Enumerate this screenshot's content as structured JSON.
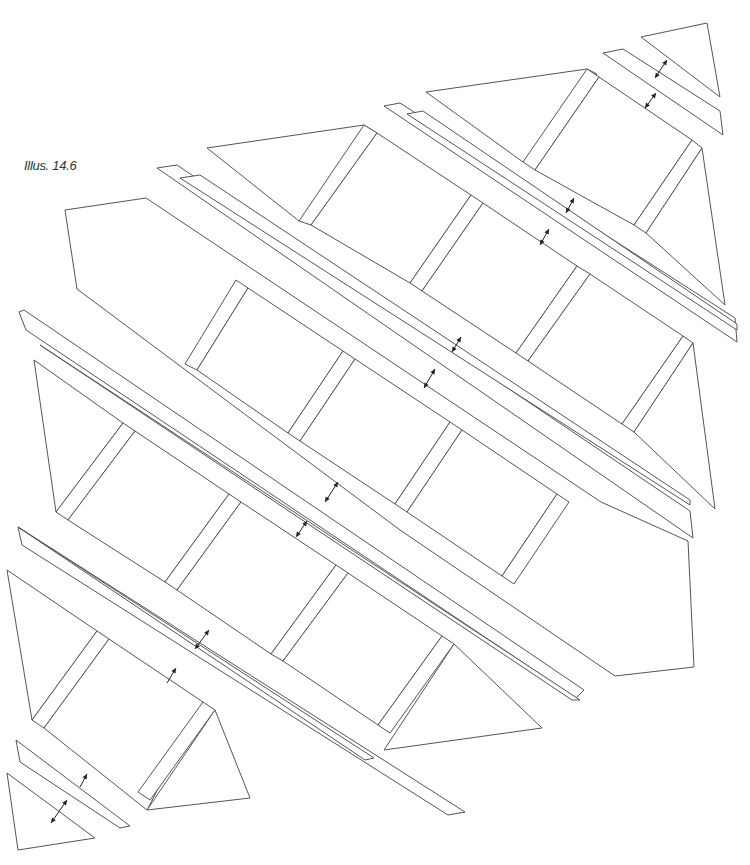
{
  "caption": "Illus. 14.6",
  "colors": {
    "stroke": "#555555",
    "arrow": "#222222",
    "background": "#ffffff"
  },
  "pieces": [
    {
      "id": "tri-top-right-corner",
      "points": "641,37 707,23 720,97"
    },
    {
      "id": "strip-a-top",
      "points": "603,53 623,49 720,111 723,135"
    },
    {
      "id": "row1-left-tri",
      "points": "426,92 587,69 597,74 523,162"
    },
    {
      "id": "row1-sash-1",
      "points": "587,69 599,77 535,170 523,162"
    },
    {
      "id": "row1-block-1",
      "points": "599,77 692,140 634,225 535,170"
    },
    {
      "id": "row1-sash-2",
      "points": "692,140 702,148 646,233 634,225"
    },
    {
      "id": "row1-right-tri",
      "points": "702,148 725,305 646,233"
    },
    {
      "id": "strip-b1",
      "points": "384,106 400,103 735,318 737,342"
    },
    {
      "id": "strip-b2",
      "points": "407,114 423,111 737,324 737,330"
    },
    {
      "id": "row2-left-tri",
      "points": "207,148 364,125 377,133 299,221"
    },
    {
      "id": "row2-sash-1",
      "points": "364,125 377,133 311,225 299,221"
    },
    {
      "id": "row2-block-1",
      "points": "377,133 471,195 410,283 311,225"
    },
    {
      "id": "row2-sash-2",
      "points": "471,195 483,203 422,291 410,283"
    },
    {
      "id": "row2-block-2",
      "points": "483,203 577,266 516,353 422,291"
    },
    {
      "id": "row2-sash-3",
      "points": "577,266 590,274 528,361 516,353"
    },
    {
      "id": "row2-block-3",
      "points": "590,274 683,336 622,424 528,361"
    },
    {
      "id": "row2-sash-4",
      "points": "683,336 693,343 634,432 622,424"
    },
    {
      "id": "row2-right-tri",
      "points": "693,343 715,509 634,432"
    },
    {
      "id": "strip-c1",
      "points": "157,168 177,165 690,511 693,538"
    },
    {
      "id": "strip-c2",
      "points": "180,178 200,175 690,500 690,505"
    },
    {
      "id": "hex-row",
      "points": "65,210 146,198 601,502 688,541 694,667 615,676 400,530 77,289"
    },
    {
      "id": "hex-sash-1",
      "points": "236,280 248,288 197,370 185,364"
    },
    {
      "id": "hex-block-1",
      "points": "248,288 343,351 288,433 197,370"
    },
    {
      "id": "hex-sash-2",
      "points": "343,351 355,359 300,441 288,433"
    },
    {
      "id": "hex-block-2",
      "points": "355,359 450,422 395,504 300,441"
    },
    {
      "id": "hex-sash-3",
      "points": "450,422 462,430 407,512 395,504"
    },
    {
      "id": "hex-block-3",
      "points": "462,430 557,494 502,576 407,512"
    },
    {
      "id": "hex-sash-4",
      "points": "557,494 569,502 514,584 502,576"
    },
    {
      "id": "strip-d1",
      "points": "19,312 24,310 584,690 576,698 26,330"
    },
    {
      "id": "strip-d2",
      "points": "40,345 572,700 580,700"
    },
    {
      "id": "row4-left-tri",
      "points": "34,360 123,423 56,512"
    },
    {
      "id": "row4-sash-1",
      "points": "123,423 135,431 68,520 56,512"
    },
    {
      "id": "row4-block-1",
      "points": "135,431 229,494 165,582 68,520"
    },
    {
      "id": "row4-sash-2",
      "points": "229,494 241,502 177,590 165,582"
    },
    {
      "id": "row4-block-2",
      "points": "241,502 336,565 271,654 177,590"
    },
    {
      "id": "row4-sash-3",
      "points": "336,565 348,573 283,661 271,654"
    },
    {
      "id": "row4-block-3",
      "points": "348,573 442,636 378,725 283,661"
    },
    {
      "id": "row4-sash-4",
      "points": "442,636 454,644 390,733 378,725"
    },
    {
      "id": "row4-right-tri",
      "points": "454,644 542,728 384,750"
    },
    {
      "id": "strip-e1",
      "points": "18,527 22,545 448,815 465,812"
    },
    {
      "id": "strip-e2",
      "points": "18,527 365,760 374,758"
    },
    {
      "id": "row5-left-tri",
      "points": "7,570 97,631 32,720"
    },
    {
      "id": "row5-sash-1",
      "points": "97,631 109,639 44,728 32,720"
    },
    {
      "id": "row5-block-1",
      "points": "109,639 203,702 147,810 44,728"
    },
    {
      "id": "row5-sash-2",
      "points": "203,702 215,710 150,800 138,792"
    },
    {
      "id": "row5-right-tri",
      "points": "215,710 250,798 147,810"
    },
    {
      "id": "strip-f",
      "points": "16,740 20,762 120,828 130,826"
    },
    {
      "id": "tri-bottom-left-corner",
      "points": "7,773 95,838 18,850"
    }
  ],
  "arrows": [
    {
      "id": "arrow-1",
      "x1": 667,
      "y1": 60,
      "x2": 655,
      "y2": 78
    },
    {
      "id": "arrow-2",
      "x1": 656,
      "y1": 93,
      "x2": 645,
      "y2": 108
    },
    {
      "id": "arrow-3",
      "x1": 574,
      "y1": 198,
      "x2": 566,
      "y2": 213
    },
    {
      "id": "arrow-4",
      "x1": 549,
      "y1": 229,
      "x2": 540,
      "y2": 245
    },
    {
      "id": "arrow-5",
      "x1": 461,
      "y1": 337,
      "x2": 452,
      "y2": 352
    },
    {
      "id": "arrow-6",
      "x1": 435,
      "y1": 369,
      "x2": 424,
      "y2": 388
    },
    {
      "id": "arrow-7",
      "x1": 338,
      "y1": 482,
      "x2": 325,
      "y2": 502
    },
    {
      "id": "arrow-8",
      "x1": 307,
      "y1": 521,
      "x2": 296,
      "y2": 537
    },
    {
      "id": "arrow-9",
      "x1": 209,
      "y1": 630,
      "x2": 195,
      "y2": 649
    },
    {
      "id": "arrow-10",
      "x1": 176,
      "y1": 668,
      "x2": 167,
      "y2": 683,
      "single": true
    },
    {
      "id": "arrow-11",
      "x1": 87,
      "y1": 774,
      "x2": 80,
      "y2": 787,
      "single": true
    },
    {
      "id": "arrow-12",
      "x1": 67,
      "y1": 800,
      "x2": 51,
      "y2": 823
    }
  ]
}
